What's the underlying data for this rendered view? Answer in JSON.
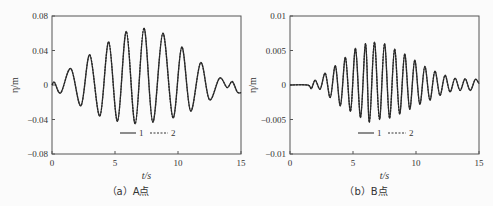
{
  "chart_data": [
    {
      "type": "line",
      "caption": "（a）A点",
      "xlabel": "t/s",
      "ylabel": "η/m",
      "xlim": [
        0,
        15
      ],
      "ylim": [
        -0.08,
        0.08
      ],
      "xticks": [
        "0",
        "5",
        "10",
        "15"
      ],
      "yticks": [
        "0.08",
        "0.04",
        "0",
        "−0.04",
        "−0.08"
      ],
      "ytick_values": [
        0.08,
        0.04,
        0,
        -0.04,
        -0.08
      ],
      "legend": [
        "1",
        "2"
      ],
      "legend_position": "bottom-center",
      "grid": false,
      "series": [
        {
          "name": "1",
          "style": "solid",
          "t": [
            0,
            0.2,
            0.7,
            1.5,
            2.3,
            3.0,
            3.8,
            4.5,
            5.2,
            5.9,
            6.6,
            7.3,
            8.0,
            8.8,
            9.6,
            10.3,
            11.0,
            11.8,
            12.5,
            13.3,
            13.9,
            14.3,
            14.7,
            15
          ],
          "eta": [
            0,
            0.003,
            -0.009,
            0.019,
            -0.024,
            0.035,
            -0.036,
            0.05,
            -0.042,
            0.062,
            -0.045,
            0.066,
            -0.043,
            0.06,
            -0.038,
            0.044,
            -0.03,
            0.026,
            -0.017,
            0.008,
            -0.003,
            0.004,
            -0.008,
            -0.009
          ]
        },
        {
          "name": "2",
          "style": "dashed",
          "t": [
            0,
            0.2,
            0.7,
            1.5,
            2.3,
            3.0,
            3.8,
            4.5,
            5.2,
            5.9,
            6.6,
            7.3,
            8.0,
            8.8,
            9.6,
            10.3,
            11.0,
            11.8,
            12.5,
            13.3,
            13.9,
            14.3,
            14.7,
            15
          ],
          "eta": [
            0,
            0.003,
            -0.009,
            0.019,
            -0.024,
            0.035,
            -0.036,
            0.05,
            -0.042,
            0.062,
            -0.045,
            0.066,
            -0.043,
            0.06,
            -0.038,
            0.044,
            -0.03,
            0.026,
            -0.017,
            0.008,
            -0.003,
            0.004,
            -0.008,
            -0.009
          ]
        }
      ]
    },
    {
      "type": "line",
      "caption": "（b）B点",
      "xlabel": "t/s",
      "ylabel": "η/m",
      "xlim": [
        0,
        15
      ],
      "ylim": [
        -0.01,
        0.01
      ],
      "xticks": [
        "0",
        "5",
        "10",
        "15"
      ],
      "yticks": [
        "0.01",
        "0.005",
        "0",
        "−0.005",
        "−0.01"
      ],
      "ytick_values": [
        0.01,
        0.005,
        0,
        -0.005,
        -0.01
      ],
      "legend": [
        "1",
        "2"
      ],
      "legend_position": "bottom-center",
      "grid": false,
      "series": [
        {
          "name": "1",
          "style": "solid",
          "t": [
            0,
            1.4,
            1.7,
            2.0,
            2.4,
            2.8,
            3.2,
            3.6,
            4.0,
            4.4,
            4.8,
            5.2,
            5.6,
            6.0,
            6.3,
            6.7,
            7.1,
            7.5,
            7.9,
            8.3,
            8.7,
            9.1,
            9.5,
            9.9,
            10.3,
            10.7,
            11.1,
            11.5,
            11.9,
            12.3,
            12.7,
            13.1,
            13.5,
            13.9,
            14.3,
            14.7,
            15
          ],
          "eta": [
            0,
            0,
            -0.0005,
            0.0007,
            -0.0006,
            0.0017,
            -0.0018,
            0.0028,
            -0.003,
            0.004,
            -0.0038,
            0.0053,
            -0.0047,
            0.006,
            -0.0054,
            0.0062,
            -0.005,
            0.006,
            -0.0048,
            0.0052,
            -0.0042,
            0.0045,
            -0.0035,
            0.0036,
            -0.0028,
            0.0027,
            -0.0022,
            0.002,
            -0.0015,
            0.0014,
            -0.001,
            0.001,
            -0.0008,
            0.0009,
            -0.0008,
            0.0008,
            0.0002
          ]
        },
        {
          "name": "2",
          "style": "dashed",
          "t": [
            0,
            1.4,
            1.7,
            2.0,
            2.4,
            2.8,
            3.2,
            3.6,
            4.0,
            4.4,
            4.8,
            5.2,
            5.6,
            6.0,
            6.3,
            6.7,
            7.1,
            7.5,
            7.9,
            8.3,
            8.7,
            9.1,
            9.5,
            9.9,
            10.3,
            10.7,
            11.1,
            11.5,
            11.9,
            12.3,
            12.7,
            13.1,
            13.5,
            13.9,
            14.3,
            14.7,
            15
          ],
          "eta": [
            0,
            0,
            -0.0005,
            0.0007,
            -0.0006,
            0.0017,
            -0.0018,
            0.0028,
            -0.003,
            0.004,
            -0.0038,
            0.0053,
            -0.0047,
            0.006,
            -0.0054,
            0.0062,
            -0.005,
            0.006,
            -0.0048,
            0.0052,
            -0.0042,
            0.0045,
            -0.0035,
            0.0036,
            -0.0028,
            0.0027,
            -0.0022,
            0.002,
            -0.0015,
            0.0014,
            -0.001,
            0.001,
            -0.0008,
            0.0009,
            -0.0008,
            0.0008,
            0.0002
          ]
        }
      ]
    }
  ]
}
